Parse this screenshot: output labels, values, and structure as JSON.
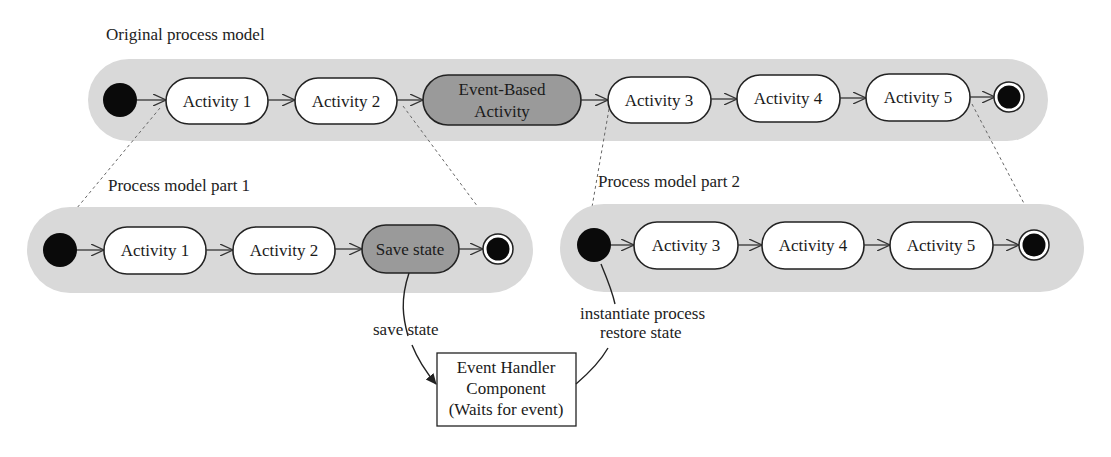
{
  "diagram": {
    "original": {
      "title": "Original process model",
      "nodes": [
        {
          "id": "start",
          "type": "initial"
        },
        {
          "id": "a1",
          "type": "activity",
          "label": "Activity 1"
        },
        {
          "id": "a2",
          "type": "activity",
          "label": "Activity 2"
        },
        {
          "id": "eb",
          "type": "event-activity",
          "label_line1": "Event-Based",
          "label_line2": "Activity"
        },
        {
          "id": "a3",
          "type": "activity",
          "label": "Activity 3"
        },
        {
          "id": "a4",
          "type": "activity",
          "label": "Activity 4"
        },
        {
          "id": "a5",
          "type": "activity",
          "label": "Activity 5"
        },
        {
          "id": "end",
          "type": "final"
        }
      ]
    },
    "part1": {
      "title": "Process model part 1",
      "nodes": [
        {
          "id": "start",
          "type": "initial"
        },
        {
          "id": "a1",
          "type": "activity",
          "label": "Activity 1"
        },
        {
          "id": "a2",
          "type": "activity",
          "label": "Activity 2"
        },
        {
          "id": "save",
          "type": "event-activity",
          "label": "Save state"
        },
        {
          "id": "end",
          "type": "final"
        }
      ]
    },
    "part2": {
      "title": "Process model part 2",
      "nodes": [
        {
          "id": "start",
          "type": "initial"
        },
        {
          "id": "a3",
          "type": "activity",
          "label": "Activity 3"
        },
        {
          "id": "a4",
          "type": "activity",
          "label": "Activity 4"
        },
        {
          "id": "a5",
          "type": "activity",
          "label": "Activity 5"
        },
        {
          "id": "end",
          "type": "final"
        }
      ]
    },
    "event_handler": {
      "line1": "Event Handler",
      "line2": "Component",
      "line3": "(Waits for event)"
    },
    "edges": {
      "save_label": "save state",
      "restore_label_line1": "instantiate process",
      "restore_label_line2": "restore state"
    },
    "colors": {
      "lane": "#d9d9d9",
      "event_activity": "#9a9a9a",
      "activity": "#ffffff",
      "node_fill": "#0a0a0a"
    }
  }
}
